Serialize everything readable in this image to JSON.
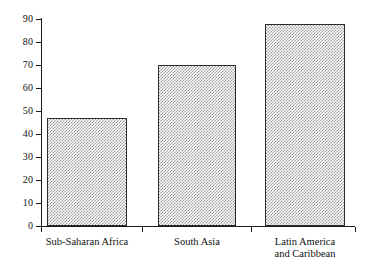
{
  "chart_data": {
    "type": "bar",
    "title": "",
    "subtitle": "",
    "xlabel": "",
    "ylabel": "",
    "categories": [
      "Sub-Saharan Africa",
      "South Asia",
      "Latin America\nand Caribbean"
    ],
    "values": [
      47,
      70,
      88
    ],
    "ylim": [
      0,
      90
    ],
    "ytick_values": [
      0,
      10,
      20,
      30,
      40,
      50,
      60,
      70,
      80,
      90
    ],
    "ytick_labels": [
      "0",
      "10",
      "20",
      "30",
      "40",
      "50",
      "60",
      "70",
      "80",
      "90"
    ],
    "grid": false,
    "legend": null,
    "series": [
      {
        "name": "",
        "values": [
          47,
          70,
          88
        ]
      }
    ],
    "bar_fill": "#9a9a9a",
    "bar_edge": "#2b2b2b",
    "axis_color": "#1a1a1a",
    "background": "#ffffff"
  }
}
